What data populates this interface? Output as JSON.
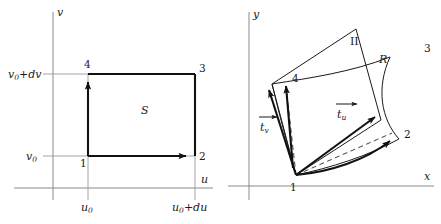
{
  "figure": {
    "ink_color": "#111111",
    "axis_color": "#8a8a8a",
    "background": "#ffffff"
  },
  "left_panel": {
    "name": "uv-plane",
    "axes": {
      "horizontal_label": "u",
      "vertical_label": "v"
    },
    "ticks": {
      "v_lower": "v",
      "v_lower_sub": "0",
      "v_upper_main": "v",
      "v_upper_sub": "0",
      "v_upper_tail": "+dv",
      "u_lower": "u",
      "u_lower_sub": "0",
      "u_upper_main": "u",
      "u_upper_sub": "0",
      "u_upper_tail": "+du"
    },
    "region_label": "S",
    "vertices": [
      {
        "id": "1",
        "label": "1"
      },
      {
        "id": "2",
        "label": "2"
      },
      {
        "id": "3",
        "label": "3"
      },
      {
        "id": "4",
        "label": "4"
      }
    ]
  },
  "right_panel": {
    "name": "xy-plane",
    "axes": {
      "horizontal_label": "x",
      "vertical_label": "y"
    },
    "region_label": "R",
    "parallelogram_label": "II",
    "vectors": [
      {
        "id": "t-u",
        "base": "t",
        "sub": "u",
        "label": "t_u"
      },
      {
        "id": "t-v",
        "base": "t",
        "sub": "v",
        "label": "t_v"
      }
    ],
    "vertices": [
      {
        "id": "1",
        "label": "1"
      },
      {
        "id": "2",
        "label": "2"
      },
      {
        "id": "3",
        "label": "3"
      },
      {
        "id": "4",
        "label": "4"
      }
    ]
  }
}
